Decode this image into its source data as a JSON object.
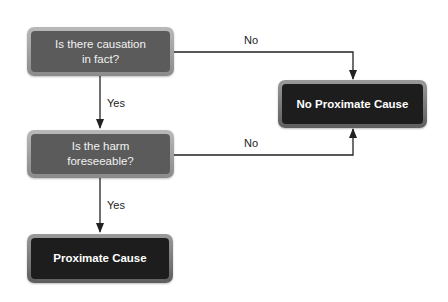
{
  "diagram": {
    "type": "flowchart",
    "nodes": {
      "q1": {
        "text": "Is there causation in fact?",
        "line1": "Is there causation",
        "line2": "in fact?",
        "kind": "decision"
      },
      "q2": {
        "text": "Is the harm foreseeable?",
        "line1": "Is the harm",
        "line2": "foreseeable?",
        "kind": "decision"
      },
      "no_cause": {
        "text": "No Proximate Cause",
        "kind": "outcome"
      },
      "cause": {
        "text": "Proximate Cause",
        "kind": "outcome"
      }
    },
    "edges": [
      {
        "from": "q1",
        "to": "q2",
        "label": "Yes"
      },
      {
        "from": "q1",
        "to": "no_cause",
        "label": "No"
      },
      {
        "from": "q2",
        "to": "no_cause",
        "label": "No"
      },
      {
        "from": "q2",
        "to": "cause",
        "label": "Yes"
      }
    ],
    "colors": {
      "decision_fill": "#5b5b5b",
      "outcome_fill": "#1d1d1d",
      "border": "#a0a0a0",
      "line": "#222222"
    }
  }
}
